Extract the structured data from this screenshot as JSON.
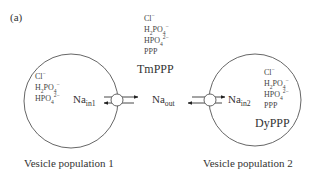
{
  "panel_label": "(a)",
  "external": {
    "ions": [
      {
        "base": "Cl",
        "sub": "",
        "sup": "−"
      },
      {
        "base": "H",
        "sub": "2",
        "base2": "PO",
        "sub2": "4",
        "sup": "−"
      },
      {
        "base": "HPO",
        "sub": "4",
        "sup": "2−"
      },
      {
        "base": "PPP",
        "sub": "",
        "sup": ""
      }
    ],
    "reagent": "TmPPP",
    "na_label": "Na",
    "na_sub": "out"
  },
  "vesicle1": {
    "ions": [
      {
        "base": "Cl",
        "sub": "",
        "sup": "−"
      },
      {
        "base": "H",
        "sub": "2",
        "base2": "PO",
        "sub2": "4",
        "sup": "−"
      },
      {
        "base": "HPO",
        "sub": "4",
        "sup": "2−"
      }
    ],
    "na_label": "Na",
    "na_sub": "in1",
    "caption": "Vesicle population 1"
  },
  "vesicle2": {
    "ions": [
      {
        "base": "Cl",
        "sub": "",
        "sup": "−"
      },
      {
        "base": "H",
        "sub": "2",
        "base2": "PO",
        "sub2": "4",
        "sup": "−"
      },
      {
        "base": "HPO",
        "sub": "4",
        "sup": "2−"
      },
      {
        "base": "PPP",
        "sub": "",
        "sup": ""
      }
    ],
    "reagent": "DyPPP",
    "na_label": "Na",
    "na_sub": "in2",
    "caption": "Vesicle population 2"
  },
  "colors": {
    "line": "#555555",
    "text": "#333333",
    "arrow": "#222222"
  }
}
